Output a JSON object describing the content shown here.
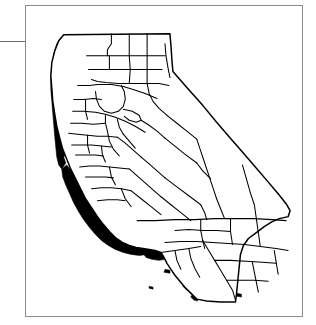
{
  "figure": {
    "type": "thematic-choropleth-map",
    "subdivision_level": "county",
    "title": "",
    "caption": "",
    "colors": {
      "background": "#ffffff",
      "land_fill": "#ffffff",
      "boundary_line": "#000000",
      "shaded_fill": "#000000",
      "frame_border": "#8a8a8a",
      "rule_line": "#6b6b6b"
    },
    "legend": {
      "present": false,
      "entries": [
        {
          "label": "",
          "swatch": "#000000"
        }
      ]
    },
    "frame": {
      "present": true,
      "left": 25,
      "top": 5,
      "width": 278,
      "height": 312
    },
    "left_rule": {
      "present": true,
      "x_start": 0,
      "x_end": 27,
      "y": 41
    }
  },
  "map_data": {
    "region_name": "California",
    "shaded_group_label": "",
    "unshaded_group_label": "",
    "shaded_regions": [
      "Del Norte",
      "Humboldt",
      "Mendocino",
      "Sonoma",
      "Marin",
      "San Francisco",
      "San Mateo",
      "Santa Cruz",
      "Monterey",
      "San Luis Obispo",
      "Santa Barbara",
      "Shasta",
      "Tehama",
      "Channel Islands"
    ],
    "shaded_count": 14,
    "counties_total": 58
  },
  "annotations": []
}
